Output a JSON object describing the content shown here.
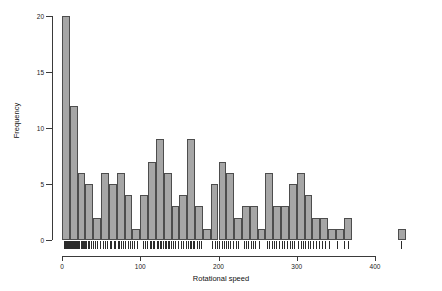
{
  "chart_data": {
    "type": "bar",
    "title": "",
    "subtitle": "",
    "xlabel": "Rotational speed",
    "ylabel": "Frequency",
    "xlim": [
      0,
      440
    ],
    "ylim": [
      0,
      20
    ],
    "grid": false,
    "legend": null,
    "binwidth": 10,
    "bin_starts": [
      0,
      10,
      20,
      30,
      40,
      50,
      60,
      70,
      80,
      90,
      100,
      110,
      120,
      130,
      140,
      150,
      160,
      170,
      180,
      190,
      200,
      210,
      220,
      230,
      240,
      250,
      260,
      270,
      280,
      290,
      300,
      310,
      320,
      330,
      340,
      350,
      360,
      370,
      380,
      390,
      400,
      410,
      420,
      430
    ],
    "categories": [
      "0-10",
      "10-20",
      "20-30",
      "30-40",
      "40-50",
      "50-60",
      "60-70",
      "70-80",
      "80-90",
      "90-100",
      "100-110",
      "110-120",
      "120-130",
      "130-140",
      "140-150",
      "150-160",
      "160-170",
      "170-180",
      "180-190",
      "190-200",
      "200-210",
      "210-220",
      "220-230",
      "230-240",
      "240-250",
      "250-260",
      "260-270",
      "270-280",
      "280-290",
      "290-300",
      "300-310",
      "310-320",
      "320-330",
      "330-340",
      "340-350",
      "350-360",
      "360-370",
      "370-380",
      "380-390",
      "390-400",
      "400-410",
      "410-420",
      "420-430",
      "430-440"
    ],
    "values": [
      20,
      12,
      6,
      5,
      2,
      6,
      5,
      6,
      4,
      1,
      4,
      7,
      9,
      6,
      3,
      4,
      9,
      3,
      1,
      5,
      7,
      6,
      2,
      3,
      3,
      1,
      6,
      3,
      3,
      5,
      6,
      4,
      2,
      2,
      1,
      1,
      2,
      0,
      0,
      0,
      0,
      0,
      0,
      1
    ],
    "y_ticks": [
      0,
      5,
      10,
      15,
      20
    ],
    "x_ticks": [
      0,
      100,
      200,
      300,
      400
    ],
    "bar_fill": "#a6a6a6",
    "bar_stroke": "#4d4d4d",
    "axis_color": "#3a3a3a",
    "rug": {
      "present": true,
      "color": "#2b2b2b",
      "values": [
        2,
        3,
        4,
        5,
        5,
        6,
        7,
        8,
        8,
        9,
        10,
        11,
        12,
        13,
        14,
        15,
        16,
        17,
        18,
        19,
        21,
        22,
        24,
        25,
        26,
        27,
        28,
        29,
        31,
        33,
        35,
        37,
        39,
        42,
        45,
        48,
        52,
        55,
        58,
        61,
        63,
        66,
        68,
        71,
        73,
        75,
        78,
        81,
        84,
        87,
        89,
        92,
        96,
        103,
        106,
        109,
        112,
        114,
        116,
        118,
        121,
        123,
        125,
        127,
        129,
        131,
        133,
        135,
        137,
        139,
        142,
        145,
        148,
        152,
        155,
        158,
        161,
        163,
        165,
        167,
        169,
        172,
        175,
        178,
        192,
        195,
        198,
        201,
        204,
        207,
        209,
        212,
        215,
        218,
        222,
        225,
        232,
        235,
        238,
        241,
        244,
        247,
        252,
        262,
        265,
        268,
        271,
        274,
        277,
        281,
        284,
        287,
        291,
        294,
        297,
        302,
        305,
        308,
        311,
        314,
        317,
        321,
        325,
        329,
        332,
        336,
        341,
        352,
        361,
        366,
        433
      ]
    }
  },
  "axis": {
    "y_labels": [
      "0",
      "5",
      "10",
      "15",
      "20"
    ],
    "x_labels": [
      "0",
      "100",
      "200",
      "300",
      "400"
    ],
    "x_title": "Rotational speed",
    "y_title": "Frequency"
  }
}
